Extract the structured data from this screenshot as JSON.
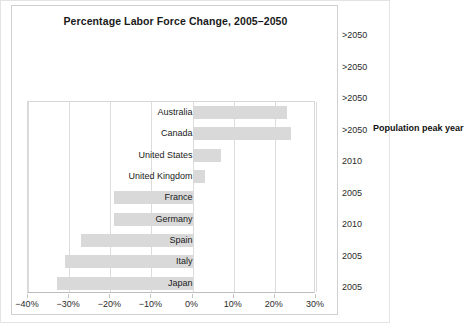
{
  "chart_data": {
    "type": "bar",
    "orientation": "horizontal",
    "title": "Percentage Labor Force Change, 2005–2050",
    "xlabel": "",
    "ylabel": "",
    "categories": [
      "Australia",
      "Canada",
      "United States",
      "United Kingdom",
      "France",
      "Germany",
      "Spain",
      "Italy",
      "Japan"
    ],
    "values": [
      23,
      24,
      7,
      3,
      -19,
      -19,
      -27,
      -31,
      -33
    ],
    "series": [
      {
        "name": "Percentage labor force change 2005-2050",
        "values": [
          23,
          24,
          7,
          3,
          -19,
          -19,
          -27,
          -31,
          -33
        ]
      }
    ],
    "xlim": [
      -40,
      30
    ],
    "xticks": [
      -40,
      -30,
      -20,
      -10,
      0,
      10,
      20,
      30
    ],
    "xtick_labels": [
      "−40%",
      "−30%",
      "−20%",
      "−10%",
      "0%",
      "10%",
      "20%",
      "30%"
    ],
    "grid": true,
    "grid_axis": "x",
    "legend": false,
    "bar_color": "#d9d9d9",
    "secondary_axis": {
      "title": "Population peak year",
      "values": [
        ">2050",
        ">2050",
        ">2050",
        ">2050",
        "2010",
        "2005",
        "2010",
        "2005",
        "2005"
      ]
    }
  },
  "colors": {
    "bar": "#d9d9d9",
    "grid": "#dcdcdc",
    "border": "#d0d0d0",
    "text": "#1a1a1a"
  }
}
